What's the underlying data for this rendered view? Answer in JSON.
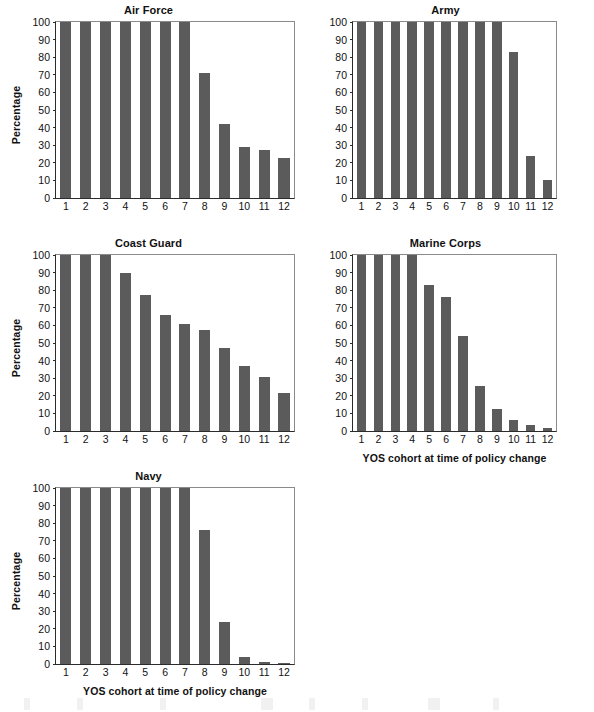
{
  "figure": {
    "axis_label_y": "Percentage",
    "axis_label_x": "YOS cohort at time of policy change",
    "bar_color": "#5b5b5b",
    "axis_color": "#2b2b2b",
    "frame_color": "#8a8a8a"
  },
  "chart_data": [
    {
      "type": "bar",
      "title": "Air Force",
      "xlabel": "",
      "ylabel": "Percentage",
      "categories": [
        "1",
        "2",
        "3",
        "4",
        "5",
        "6",
        "7",
        "8",
        "9",
        "10",
        "11",
        "12"
      ],
      "values": [
        100,
        100,
        100,
        100,
        100,
        100,
        100,
        71,
        42,
        29,
        27,
        23
      ],
      "ylim": [
        0,
        100
      ],
      "yticks": [
        0,
        10,
        20,
        30,
        40,
        50,
        60,
        70,
        80,
        90,
        100
      ],
      "grid": false,
      "legend": "none"
    },
    {
      "type": "bar",
      "title": "Army",
      "xlabel": "",
      "ylabel": "",
      "categories": [
        "1",
        "2",
        "3",
        "4",
        "5",
        "6",
        "7",
        "8",
        "9",
        "10",
        "11",
        "12"
      ],
      "values": [
        100,
        100,
        100,
        100,
        100,
        100,
        100,
        100,
        100,
        83,
        24,
        10
      ],
      "ylim": [
        0,
        100
      ],
      "yticks": [
        0,
        10,
        20,
        30,
        40,
        50,
        60,
        70,
        80,
        90,
        100
      ],
      "grid": false,
      "legend": "none"
    },
    {
      "type": "bar",
      "title": "Coast Guard",
      "xlabel": "",
      "ylabel": "Percentage",
      "categories": [
        "1",
        "2",
        "3",
        "4",
        "5",
        "6",
        "7",
        "8",
        "9",
        "10",
        "11",
        "12"
      ],
      "values": [
        100,
        100,
        100,
        90,
        77,
        66,
        61,
        57.5,
        47,
        37,
        30.5,
        21.5
      ],
      "ylim": [
        0,
        100
      ],
      "yticks": [
        0,
        10,
        20,
        30,
        40,
        50,
        60,
        70,
        80,
        90,
        100
      ],
      "grid": false,
      "legend": "none"
    },
    {
      "type": "bar",
      "title": "Marine Corps",
      "xlabel": "YOS cohort at time of policy change",
      "ylabel": "",
      "categories": [
        "1",
        "2",
        "3",
        "4",
        "5",
        "6",
        "7",
        "8",
        "9",
        "10",
        "11",
        "12"
      ],
      "values": [
        100,
        100,
        100,
        100,
        83,
        76,
        54,
        25.5,
        12.5,
        6.5,
        3.5,
        1.5
      ],
      "ylim": [
        0,
        100
      ],
      "yticks": [
        0,
        10,
        20,
        30,
        40,
        50,
        60,
        70,
        80,
        90,
        100
      ],
      "grid": false,
      "legend": "none"
    },
    {
      "type": "bar",
      "title": "Navy",
      "xlabel": "YOS cohort at time of policy change",
      "ylabel": "Percentage",
      "categories": [
        "1",
        "2",
        "3",
        "4",
        "5",
        "6",
        "7",
        "8",
        "9",
        "10",
        "11",
        "12"
      ],
      "values": [
        100,
        100,
        100,
        100,
        100,
        100,
        100,
        76,
        24,
        4,
        1,
        0.8
      ],
      "ylim": [
        0,
        100
      ],
      "yticks": [
        0,
        10,
        20,
        30,
        40,
        50,
        60,
        70,
        80,
        90,
        100
      ],
      "grid": false,
      "legend": "none"
    }
  ]
}
